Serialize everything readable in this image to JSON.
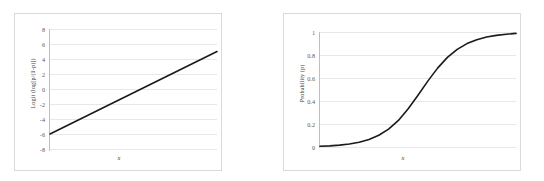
{
  "figure": {
    "background_color": "#ffffff",
    "panel_border_color": "#d9d9d9",
    "gridline_color": "#e8e8e8",
    "curve_color": "#1a1a1a"
  },
  "chart_data": [
    {
      "type": "line",
      "title": "",
      "xlabel": "x",
      "ylabel": "Logit (log[p/(1-p)])",
      "ylim": [
        -8,
        8
      ],
      "xlim": [
        0,
        1
      ],
      "yticks": [
        "8",
        "6",
        "4",
        "2",
        "0",
        "-2",
        "-4",
        "-6",
        "-8"
      ],
      "ytick_values": [
        8,
        6,
        4,
        2,
        0,
        -2,
        -4,
        -6,
        -8
      ],
      "xticks": [],
      "grid": true,
      "legend": "none",
      "series": [
        {
          "name": "logit",
          "x": [
            0.0,
            0.1,
            0.2,
            0.3,
            0.4,
            0.5,
            0.6,
            0.7,
            0.8,
            0.9,
            1.0
          ],
          "values": [
            -6.0,
            -4.9,
            -3.8,
            -2.7,
            -1.6,
            -0.5,
            0.6,
            1.7,
            2.8,
            3.9,
            5.0
          ]
        }
      ]
    },
    {
      "type": "line",
      "title": "",
      "xlabel": "x",
      "ylabel": "Probability (p)",
      "ylim": [
        0,
        1
      ],
      "xlim": [
        0,
        1
      ],
      "yticks": [
        "1",
        "0.8",
        "0.6",
        "0.4",
        "0.2",
        "0"
      ],
      "ytick_values": [
        1,
        0.8,
        0.6,
        0.4,
        0.2,
        0
      ],
      "xticks": [],
      "grid": true,
      "legend": "none",
      "series": [
        {
          "name": "probability",
          "x": [
            0.0,
            0.05,
            0.1,
            0.15,
            0.2,
            0.25,
            0.3,
            0.35,
            0.4,
            0.45,
            0.5,
            0.55,
            0.6,
            0.65,
            0.7,
            0.75,
            0.8,
            0.85,
            0.9,
            0.95,
            1.0
          ],
          "values": [
            0.006,
            0.01,
            0.016,
            0.026,
            0.042,
            0.066,
            0.102,
            0.155,
            0.231,
            0.332,
            0.45,
            0.573,
            0.686,
            0.779,
            0.849,
            0.899,
            0.933,
            0.956,
            0.971,
            0.981,
            0.988
          ]
        }
      ]
    }
  ]
}
